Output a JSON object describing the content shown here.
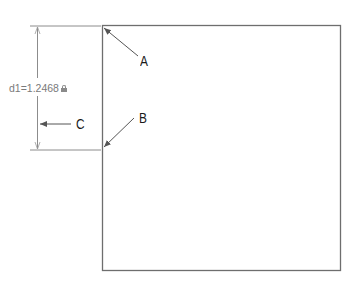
{
  "dimension": {
    "name": "d1",
    "value": "1.2468",
    "label": "d1=1.2468",
    "locked": true,
    "icon": "lock-icon"
  },
  "callouts": {
    "A": "A",
    "B": "B",
    "C": "C"
  },
  "colors": {
    "shape_stroke": "#6e6e6e",
    "dimension_stroke": "#8c8c8c",
    "dimension_text": "#7a7a7a",
    "callout_text": "#1a1a1a"
  }
}
